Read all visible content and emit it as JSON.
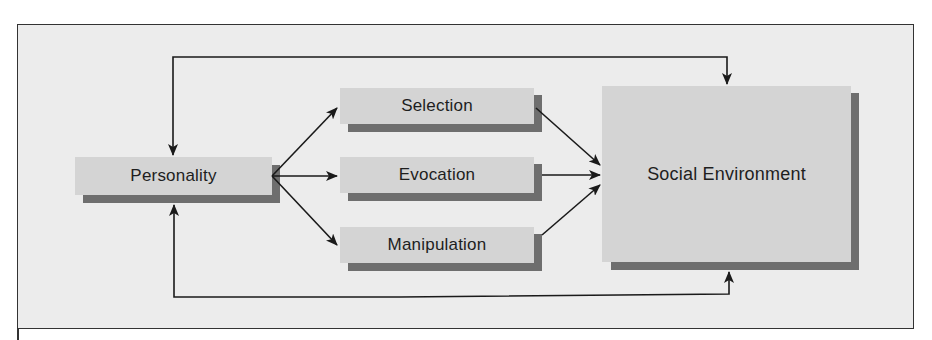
{
  "diagram": {
    "nodes": {
      "personality": "Personality",
      "selection": "Selection",
      "evocation": "Evocation",
      "manipulation": "Manipulation",
      "social_environment": "Social Environment"
    },
    "edges": [
      {
        "from": "Personality",
        "to": "Selection"
      },
      {
        "from": "Personality",
        "to": "Evocation"
      },
      {
        "from": "Personality",
        "to": "Manipulation"
      },
      {
        "from": "Selection",
        "to": "Social Environment"
      },
      {
        "from": "Evocation",
        "to": "Social Environment"
      },
      {
        "from": "Manipulation",
        "to": "Social Environment"
      },
      {
        "from": "Social Environment",
        "to": "Personality",
        "route": "top"
      },
      {
        "from": "Personality",
        "to": "Social Environment",
        "route": "bottom"
      }
    ],
    "colors": {
      "background": "#ececec",
      "box_fill": "#d4d4d4",
      "box_shadow": "#6e6e6e",
      "line": "#1a1a1a"
    }
  }
}
